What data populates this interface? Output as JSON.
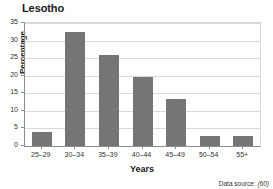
{
  "chart_data": {
    "type": "bar",
    "title": "Lesotho",
    "subtitle": "",
    "xlabel": "Years",
    "ylabel": "Percentage",
    "categories": [
      "25–29",
      "30–34",
      "35–39",
      "40–44",
      "45–49",
      "50–54",
      "55+"
    ],
    "values": [
      4.0,
      32.4,
      26.0,
      19.7,
      13.3,
      2.9,
      2.9
    ],
    "ylim": [
      0,
      35
    ],
    "yticks": [
      0,
      5,
      10,
      15,
      20,
      25,
      30,
      35
    ],
    "ytick_labels": [
      "0",
      "5",
      "10",
      "15",
      "20",
      "25",
      "30",
      "35"
    ],
    "grid": true,
    "grid_axis": "y",
    "legend": false,
    "legend_position": "none",
    "bar_color": "#6e6e6e",
    "grid_color": "#d9d9d9",
    "axis_color": "#8c8c8c",
    "text_color": "#231f20"
  },
  "footnote": {
    "label": "Data source:",
    "reference": "(60)"
  }
}
